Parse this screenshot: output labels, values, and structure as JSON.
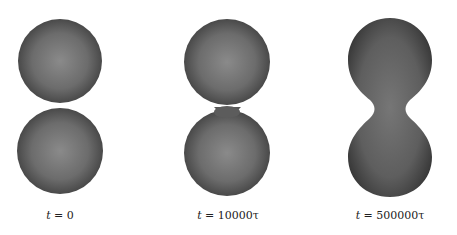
{
  "figure": {
    "panels": [
      {
        "id": "panel-1",
        "label_var": "t",
        "label_eq": " = ",
        "label_val": "0",
        "shape": "two touching spheres"
      },
      {
        "id": "panel-2",
        "label_var": "t",
        "label_eq": " = ",
        "label_val": "10000τ",
        "shape": "two spheres joined by thin neck"
      },
      {
        "id": "panel-3",
        "label_var": "t",
        "label_eq": " = ",
        "label_val": "500000τ",
        "shape": "peanut-shaped merged droplet"
      }
    ],
    "colors": {
      "surface_dark": "#3a3a3a",
      "surface_mid": "#6a6a6a",
      "surface_light": "#8c8c8c",
      "background": "#ffffff"
    }
  }
}
